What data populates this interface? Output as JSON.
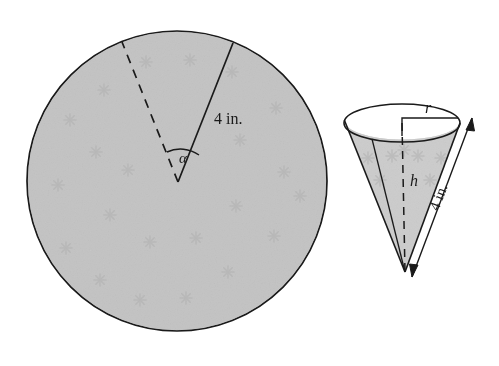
{
  "figure": {
    "background_color": "#ffffff",
    "ink_color": "#1a1a1a",
    "fill_color": "#c3c3c3",
    "cone_fill_color": "#cccccc",
    "pattern_color": "#aeaeae"
  },
  "circle_figure": {
    "name": "paper-disk-with-sector",
    "center_x": 177,
    "center_y": 181,
    "radius": 150,
    "sector": {
      "angle_label": "α",
      "radius_label": "4 in.",
      "solid_radius_label": "4 in.",
      "dashed_side": "left",
      "solid_side": "right",
      "apex_x": 178,
      "apex_y": 182
    }
  },
  "cone_figure": {
    "name": "cone",
    "radius_label": "r",
    "height_label": "h",
    "slant_label": "4 in.",
    "apex_x": 405,
    "apex_y": 272,
    "rim_center_x": 402,
    "rim_center_y": 123,
    "rim_rx": 58,
    "rim_ry": 19
  },
  "labels": {
    "circle_radius": "4 in.",
    "circle_angle": "α",
    "cone_radius": "r",
    "cone_height": "h",
    "cone_slant": "4 in."
  }
}
